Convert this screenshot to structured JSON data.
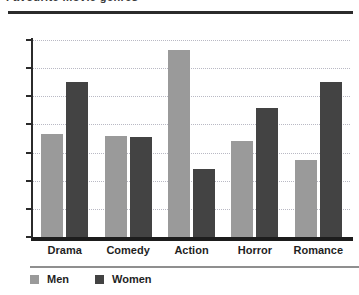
{
  "title": {
    "text": "Favourite movie genres",
    "clipped": true
  },
  "legend": {
    "position": "bottom-left",
    "items": [
      {
        "label": "Men",
        "color": "#9a9a9a",
        "swatch": "legend-swatch-men"
      },
      {
        "label": "Women",
        "color": "#434343",
        "swatch": "legend-swatch-women"
      }
    ]
  },
  "axes": {
    "y_ticks": [
      "0",
      "2",
      "4",
      "6",
      "8",
      "10",
      "12",
      "14"
    ],
    "x_labels": [
      "Drama",
      "Comedy",
      "Action",
      "Horror",
      "Romance"
    ]
  },
  "chart_data": {
    "type": "bar",
    "title": "Favourite movie genres",
    "xlabel": "",
    "ylabel": "",
    "categories": [
      "Drama",
      "Comedy",
      "Action",
      "Horror",
      "Romance"
    ],
    "series": [
      {
        "name": "Men",
        "color": "#9a9a9a",
        "values": [
          7.3,
          7.2,
          13.3,
          6.8,
          5.5
        ]
      },
      {
        "name": "Women",
        "color": "#434343",
        "values": [
          11.0,
          7.1,
          4.8,
          9.2,
          11.0
        ]
      }
    ],
    "ylim": [
      0,
      14
    ],
    "ytick_step": 2,
    "grid": true,
    "grid_style": "dotted-horizontal",
    "legend_position": "bottom-left",
    "grouping": "grouped"
  }
}
